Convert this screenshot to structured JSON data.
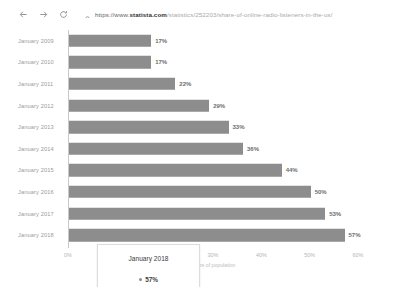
{
  "browser": {
    "back_icon": "back-arrow-icon",
    "forward_icon": "forward-arrow-icon",
    "reload_icon": "reload-icon",
    "lock_icon": "lock-icon",
    "url_scheme": "https://www.",
    "url_domain": "statista.com",
    "url_path": "/statistics/252203/share-of-online-radio-listeners-in-the-us/"
  },
  "tooltip": {
    "title": "January 2018",
    "value": "57%",
    "marker": "series-dot-icon"
  },
  "chart_data": {
    "type": "bar",
    "orientation": "horizontal",
    "title": "",
    "xlabel": "Share of population",
    "ylabel": "",
    "xlim": [
      0,
      60
    ],
    "grid": false,
    "legend": false,
    "categories": [
      "January 2009",
      "January 2010",
      "January 2011",
      "January 2012",
      "January 2013",
      "January 2014",
      "January 2015",
      "January 2016",
      "January 2017",
      "January 2018"
    ],
    "values": [
      17,
      17,
      22,
      29,
      33,
      36,
      44,
      50,
      53,
      57
    ],
    "data_labels": [
      "17%",
      "17%",
      "22%",
      "29%",
      "33%",
      "36%",
      "44%",
      "50%",
      "53%",
      "57%"
    ],
    "xticks": [
      0,
      10,
      20,
      30,
      40,
      50,
      60
    ],
    "xticklabels": [
      "0%",
      "10%",
      "20%",
      "30%",
      "40%",
      "50%",
      "60%"
    ],
    "bar_color": "#8d8d8d"
  }
}
